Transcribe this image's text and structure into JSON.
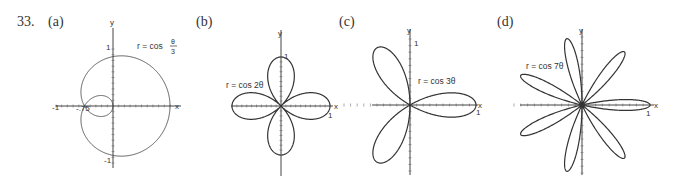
{
  "problem_number": "33.",
  "chart_data": [
    {
      "type": "line",
      "panel_label": "(a)",
      "title": "r = cos θ/3",
      "equation": {
        "lhs": "r = cos",
        "num": "θ",
        "den": "3"
      },
      "polar": {
        "k": 0.3333333,
        "theta_max_pi": 3
      },
      "xlabel": "x",
      "ylabel": "y",
      "tick_labels": {
        "x_neg": "-1",
        "x_pos": "",
        "y_pos": "1",
        "y_neg": "-1",
        "inner": "-.75"
      },
      "origin": [
        113,
        106
      ],
      "scale": 57,
      "stroke_width": 0.8,
      "axis_extent": {
        "left": 57,
        "right": 68,
        "up": 78,
        "down": 62
      }
    },
    {
      "type": "line",
      "panel_label": "(b)",
      "title": "r = cos 2θ",
      "equation_text": "r = cos 2θ",
      "polar": {
        "k": 2,
        "theta_max_pi": 2
      },
      "xlabel": "x",
      "ylabel": "y",
      "tick_labels": {
        "x_pos": "1",
        "y_pos": "1"
      },
      "origin": [
        281,
        106
      ],
      "scale": 49,
      "stroke_width": 1.2,
      "axis_extent": {
        "left": 50,
        "right": 52,
        "up": 76,
        "down": 70
      }
    },
    {
      "type": "line",
      "panel_label": "(c)",
      "title": "r = cos 3θ",
      "equation_text": "r = cos 3θ",
      "polar": {
        "k": 3,
        "theta_max_pi": 1
      },
      "xlabel": "x",
      "ylabel": "y",
      "tick_labels": {
        "x_pos": "1",
        "y_pos": "1"
      },
      "origin": [
        410,
        105
      ],
      "scale": 66,
      "stroke_width": 1.2,
      "axis_extent": {
        "left": 38,
        "right": 68,
        "up": 76,
        "down": 70
      }
    },
    {
      "type": "line",
      "panel_label": "(d)",
      "title": "r = cos 7θ",
      "equation_text": "r = cos 7θ",
      "polar": {
        "k": 7,
        "theta_max_pi": 1
      },
      "xlabel": "x",
      "ylabel": "y",
      "tick_labels": {
        "x_pos": "1",
        "y_pos": ""
      },
      "origin": [
        582,
        105
      ],
      "scale": 68,
      "stroke_width": 1.2,
      "axis_extent": {
        "left": 62,
        "right": 72,
        "up": 76,
        "down": 70
      }
    }
  ]
}
